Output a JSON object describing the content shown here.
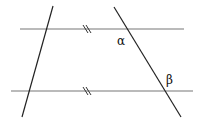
{
  "diagram": {
    "type": "geometry",
    "labels": {
      "alpha": "α",
      "beta": "β"
    },
    "lines": {
      "top_parallel": {
        "x1": 20,
        "y1": 29,
        "x2": 184,
        "y2": 29
      },
      "bottom_parallel": {
        "x1": 11,
        "y1": 91,
        "x2": 193,
        "y2": 91
      },
      "left_transversal": {
        "x1": 53,
        "y1": 6,
        "x2": 22,
        "y2": 117
      },
      "right_transversal": {
        "x1": 114,
        "y1": 7,
        "x2": 181,
        "y2": 117
      }
    },
    "parallel_marks": "//",
    "colors": {
      "parallel": "#777777",
      "transversal": "#222222"
    }
  }
}
